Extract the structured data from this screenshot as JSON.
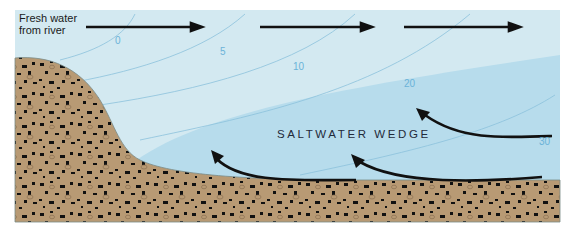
{
  "diagram": {
    "title_text": "Fresh water from river",
    "river_label_lines": [
      "Fresh water",
      "from river"
    ],
    "wedge_label": "SALTWATER WEDGE",
    "salinity_isolines": [
      {
        "value": "0",
        "x": 115,
        "y": 35
      },
      {
        "value": "5",
        "x": 220,
        "y": 46
      },
      {
        "value": "10",
        "x": 293,
        "y": 61
      },
      {
        "value": "20",
        "x": 404,
        "y": 78
      },
      {
        "value": "30",
        "x": 539,
        "y": 136
      }
    ],
    "surface_flow_arrows": 3,
    "bottom_flow_arrows": 3,
    "colors": {
      "fresh_water": "#d3e9f1",
      "salt_wedge": "#b7dcec",
      "sediment": "#b89a74",
      "pebble": "#111111",
      "isoline": "#8cc2dc",
      "arrow": "#111111"
    }
  }
}
